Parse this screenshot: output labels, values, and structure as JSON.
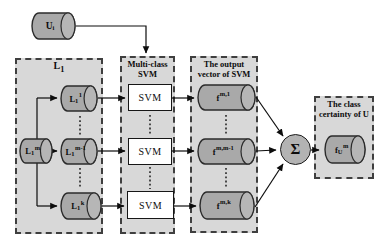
{
  "colors": {
    "panel_fill": "#d8d8d8",
    "panel_border": "#3f3f3f",
    "cylinder_fill": "#a9a9a9",
    "cylinder_rim": "#b6b6b6",
    "outline": "#2b2b2b",
    "svm_box_fill": "#ffffff",
    "background": "#ffffff"
  },
  "input_cylinder": {
    "base": "U",
    "sub": "i"
  },
  "panels": {
    "l1": {
      "title_base": "L",
      "title_sub": "1"
    },
    "svm": {
      "title": "Multi-class SVM"
    },
    "output": {
      "title": "The output vector of SVM"
    },
    "certainty": {
      "title": "The class certainty of U"
    }
  },
  "cylinders": {
    "l1_1": {
      "base": "L",
      "sub": "1",
      "sup": "1"
    },
    "l1_m": {
      "base": "L",
      "sub": "1",
      "sup": "m"
    },
    "l1_m1": {
      "base": "L",
      "sub": "1",
      "sup": "m-1"
    },
    "l1_k": {
      "base": "L",
      "sub": "1",
      "sup": "k"
    },
    "f_m1": {
      "base": "f",
      "sup": "m,1"
    },
    "f_mm1": {
      "base": "f",
      "sup": "m,m-1"
    },
    "f_mk": {
      "base": "f",
      "sup": "m,k"
    },
    "f_u": {
      "base": "f",
      "sub": "U",
      "sup": "m"
    }
  },
  "svm_boxes": [
    "SVM",
    "SVM",
    "SVM"
  ],
  "sum_symbol": "Σ",
  "ellipsis_symbol": "⋮"
}
